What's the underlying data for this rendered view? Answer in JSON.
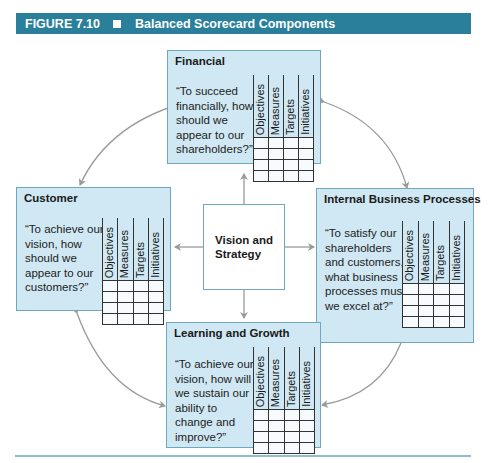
{
  "header": {
    "figure_label": "FIGURE 7.10",
    "title": "Balanced Scorecard Components",
    "color": "#2a7f9a"
  },
  "center": {
    "line1": "Vision and",
    "line2": "Strategy"
  },
  "columns": [
    "Objectives",
    "Measures",
    "Targets",
    "Initiatives"
  ],
  "perspectives": {
    "financial": {
      "title": "Financial",
      "question": [
        "“To succeed",
        "financially, how",
        "should we",
        "appear to our",
        "shareholders?”"
      ]
    },
    "customer": {
      "title": "Customer",
      "question": [
        "“To achieve our",
        "vision, how",
        "should we",
        "appear to our",
        "customers?”"
      ]
    },
    "internal": {
      "title": "Internal Business Processes",
      "question": [
        "“To satisfy our",
        "shareholders",
        "and customers,",
        "what business",
        "processes must",
        "we excel at?”"
      ]
    },
    "learning": {
      "title": "Learning and Growth",
      "question": [
        "“To achieve our",
        "vision, how will",
        "we sustain our",
        "ability to",
        "change and",
        "improve?”"
      ]
    }
  },
  "colors": {
    "box_fill": "#cfe8f3",
    "box_border": "#6fa7bf",
    "arrow": "#9a9a9a"
  }
}
